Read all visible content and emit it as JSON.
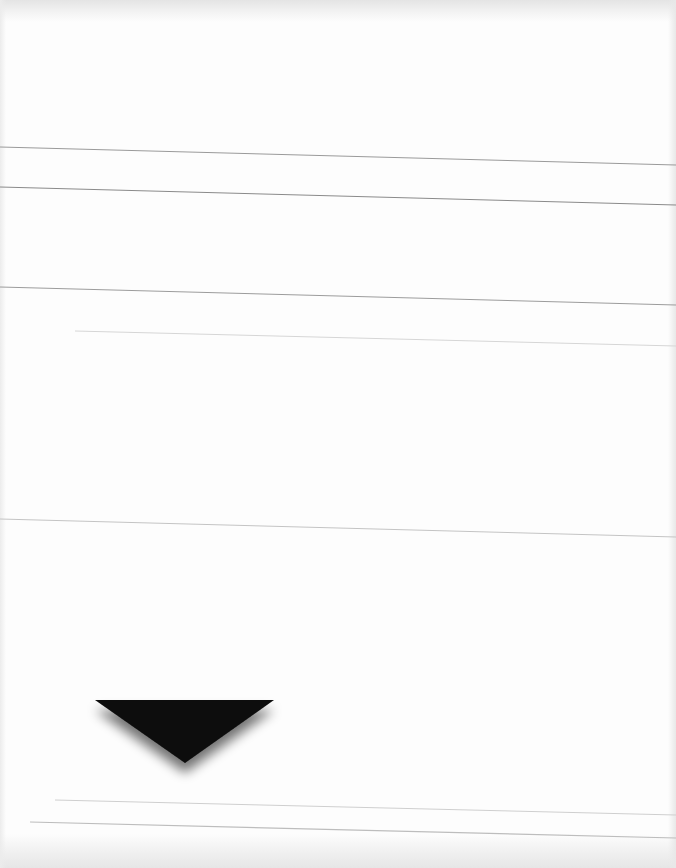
{
  "page": {
    "background": "#fdfdfd",
    "width": 676,
    "height": 868
  },
  "ruled_lines": [
    {
      "x1": 0,
      "y1": 147,
      "x2": 676,
      "y2": 165,
      "color": "#9a9a9a",
      "width": 1
    },
    {
      "x1": 0,
      "y1": 187,
      "x2": 676,
      "y2": 205,
      "color": "#8a8a8a",
      "width": 1
    },
    {
      "x1": 0,
      "y1": 287,
      "x2": 676,
      "y2": 305,
      "color": "#9c9c9c",
      "width": 1
    },
    {
      "x1": 75,
      "y1": 331,
      "x2": 676,
      "y2": 346,
      "color": "#d6d6d6",
      "width": 1
    },
    {
      "x1": 0,
      "y1": 519,
      "x2": 676,
      "y2": 537,
      "color": "#c4c4c4",
      "width": 1
    },
    {
      "x1": 55,
      "y1": 800,
      "x2": 676,
      "y2": 815,
      "color": "#cfcfcf",
      "width": 1
    },
    {
      "x1": 30,
      "y1": 822,
      "x2": 676,
      "y2": 838,
      "color": "#bdbdbd",
      "width": 1.2
    }
  ],
  "marker": {
    "shape": "downward-triangle",
    "points": "95,700 274,700 185,763",
    "fill": "#0a0a0a",
    "shadow_color": "rgba(0,0,0,0.55)"
  }
}
